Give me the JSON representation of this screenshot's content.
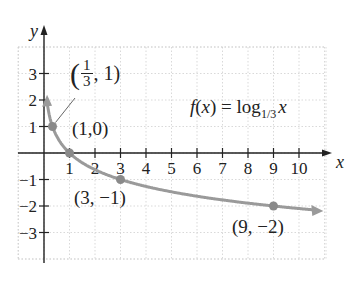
{
  "chart_data": {
    "type": "line",
    "title": "",
    "function_label": "f(x) = log_1/3 x",
    "function_label_parts": {
      "prefix": "f(x) = log",
      "base": "1/3",
      "arg": "x"
    },
    "xlabel": "x",
    "ylabel": "y",
    "xlim": [
      -1,
      11
    ],
    "ylim": [
      -4,
      4
    ],
    "x_ticks": [
      1,
      2,
      3,
      4,
      5,
      6,
      7,
      8,
      9,
      10
    ],
    "y_ticks": [
      -3,
      -2,
      -1,
      1,
      2,
      3
    ],
    "x_tick_labels": [
      "1",
      "2",
      "3",
      "4",
      "5",
      "6",
      "7",
      "8",
      "9",
      "10"
    ],
    "y_tick_labels": [
      "−3",
      "−2",
      "−1",
      "1",
      "2",
      "3"
    ],
    "grid": true,
    "series": [
      {
        "name": "f(x) = log_1/3 x",
        "color": "#9a9a9a",
        "x": [
          0.11,
          0.2,
          0.333,
          0.5,
          1,
          2,
          3,
          4,
          5,
          6,
          7,
          8,
          9,
          10.5
        ],
        "y": [
          2,
          1.465,
          1,
          0.631,
          0,
          -0.631,
          -1,
          -1.262,
          -1.465,
          -1.631,
          -1.771,
          -1.893,
          -2,
          -2.14
        ]
      }
    ],
    "points": [
      {
        "x": 0.333,
        "y": 1,
        "label": "(1/3, 1)"
      },
      {
        "x": 1,
        "y": 0,
        "label": "(1,0)"
      },
      {
        "x": 3,
        "y": -1,
        "label": "(3, −1)"
      },
      {
        "x": 9,
        "y": -2,
        "label": "(9, −2)"
      }
    ],
    "annotations": {
      "p1_open": "(",
      "p1_num": "1",
      "p1_den": "3",
      "p1_rest": ", 1)",
      "p2": "(1,0)",
      "p3": "(3, −1)",
      "p4": "(9, −2)"
    }
  }
}
